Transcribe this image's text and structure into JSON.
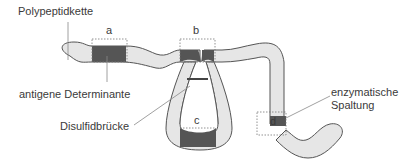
{
  "colors": {
    "chain_fill": "#e6e6e6",
    "chain_stroke": "#555555",
    "determinant_fill": "#555555",
    "dotted_box": "#777777",
    "leader_line": "#888888",
    "text": "#3a3a3a"
  },
  "labels": {
    "polypeptide_chain": "Polypeptidkette",
    "antigenic_determinant": "antigene Determinante",
    "disulfide_bridge": "Disulfidbrücke",
    "enzymatic_cleavage_line1": "enzymatische",
    "enzymatic_cleavage_line2": "Spaltung"
  },
  "sites": [
    {
      "id": "a",
      "label": "a"
    },
    {
      "id": "b",
      "label": "b"
    },
    {
      "id": "c",
      "label": "c"
    },
    {
      "id": "d",
      "label": "d"
    }
  ]
}
